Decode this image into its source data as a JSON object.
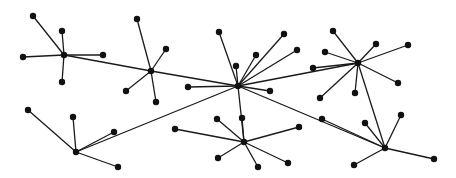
{
  "diagram": {
    "type": "network-graph",
    "colors": {
      "edge": "#1a1a1a",
      "node": "#111111",
      "background": "#ffffff"
    },
    "node_radius": 3.2,
    "nodes": [
      {
        "id": "h1",
        "x": 64,
        "y": 55,
        "role": "hub"
      },
      {
        "id": "a1",
        "x": 33,
        "y": 16
      },
      {
        "id": "a2",
        "x": 62,
        "y": 31
      },
      {
        "id": "a3",
        "x": 23,
        "y": 57
      },
      {
        "id": "a4",
        "x": 103,
        "y": 55
      },
      {
        "id": "a5",
        "x": 62,
        "y": 82
      },
      {
        "id": "h2",
        "x": 151,
        "y": 71,
        "role": "hub"
      },
      {
        "id": "b1",
        "x": 137,
        "y": 19
      },
      {
        "id": "b2",
        "x": 166,
        "y": 49
      },
      {
        "id": "b3",
        "x": 126,
        "y": 91
      },
      {
        "id": "b4",
        "x": 156,
        "y": 102
      },
      {
        "id": "hc",
        "x": 238,
        "y": 86,
        "role": "hub"
      },
      {
        "id": "c1",
        "x": 219,
        "y": 32
      },
      {
        "id": "c2",
        "x": 284,
        "y": 34
      },
      {
        "id": "c3",
        "x": 256,
        "y": 55
      },
      {
        "id": "c4",
        "x": 236,
        "y": 66
      },
      {
        "id": "c5",
        "x": 297,
        "y": 50
      },
      {
        "id": "c6",
        "x": 270,
        "y": 91
      },
      {
        "id": "c7",
        "x": 188,
        "y": 87
      },
      {
        "id": "h4",
        "x": 358,
        "y": 63,
        "role": "hub"
      },
      {
        "id": "d1",
        "x": 333,
        "y": 31
      },
      {
        "id": "d2",
        "x": 376,
        "y": 44
      },
      {
        "id": "d3",
        "x": 408,
        "y": 45
      },
      {
        "id": "d4",
        "x": 325,
        "y": 52
      },
      {
        "id": "d5",
        "x": 313,
        "y": 68
      },
      {
        "id": "d6",
        "x": 398,
        "y": 83
      },
      {
        "id": "d7",
        "x": 355,
        "y": 93
      },
      {
        "id": "d8",
        "x": 320,
        "y": 98
      },
      {
        "id": "h5",
        "x": 76,
        "y": 152,
        "role": "hub"
      },
      {
        "id": "e1",
        "x": 28,
        "y": 110
      },
      {
        "id": "e2",
        "x": 73,
        "y": 117
      },
      {
        "id": "e3",
        "x": 114,
        "y": 132
      },
      {
        "id": "e4",
        "x": 118,
        "y": 167
      },
      {
        "id": "h6",
        "x": 244,
        "y": 142,
        "role": "hub"
      },
      {
        "id": "f1",
        "x": 175,
        "y": 129
      },
      {
        "id": "f2",
        "x": 217,
        "y": 119
      },
      {
        "id": "f3",
        "x": 242,
        "y": 118
      },
      {
        "id": "f4",
        "x": 299,
        "y": 127
      },
      {
        "id": "f5",
        "x": 218,
        "y": 158
      },
      {
        "id": "f6",
        "x": 258,
        "y": 167
      },
      {
        "id": "f7",
        "x": 288,
        "y": 163
      },
      {
        "id": "h7",
        "x": 385,
        "y": 148,
        "role": "hub"
      },
      {
        "id": "g1",
        "x": 322,
        "y": 119
      },
      {
        "id": "g2",
        "x": 365,
        "y": 123
      },
      {
        "id": "g3",
        "x": 401,
        "y": 115
      },
      {
        "id": "g4",
        "x": 354,
        "y": 165
      },
      {
        "id": "g5",
        "x": 434,
        "y": 159
      }
    ],
    "edges": [
      [
        "h1",
        "a1"
      ],
      [
        "h1",
        "a2"
      ],
      [
        "h1",
        "a3"
      ],
      [
        "h1",
        "a4"
      ],
      [
        "h1",
        "a5"
      ],
      [
        "h1",
        "h2"
      ],
      [
        "h2",
        "b1"
      ],
      [
        "h2",
        "b2"
      ],
      [
        "h2",
        "b3"
      ],
      [
        "h2",
        "b4"
      ],
      [
        "h2",
        "hc"
      ],
      [
        "hc",
        "c1"
      ],
      [
        "hc",
        "c2"
      ],
      [
        "hc",
        "c3"
      ],
      [
        "hc",
        "c4"
      ],
      [
        "hc",
        "c5"
      ],
      [
        "hc",
        "c6"
      ],
      [
        "hc",
        "c7"
      ],
      [
        "hc",
        "h4"
      ],
      [
        "hc",
        "h5"
      ],
      [
        "hc",
        "h6"
      ],
      [
        "hc",
        "h7"
      ],
      [
        "h4",
        "d1"
      ],
      [
        "h4",
        "d2"
      ],
      [
        "h4",
        "d3"
      ],
      [
        "h4",
        "d4"
      ],
      [
        "h4",
        "d5"
      ],
      [
        "h4",
        "d6"
      ],
      [
        "h4",
        "d7"
      ],
      [
        "h4",
        "d8"
      ],
      [
        "h4",
        "h7"
      ],
      [
        "h5",
        "e1"
      ],
      [
        "h5",
        "e2"
      ],
      [
        "h5",
        "e3"
      ],
      [
        "h5",
        "e4"
      ],
      [
        "h6",
        "f1"
      ],
      [
        "h6",
        "f2"
      ],
      [
        "h6",
        "f3"
      ],
      [
        "h6",
        "f4"
      ],
      [
        "h6",
        "f5"
      ],
      [
        "h6",
        "f6"
      ],
      [
        "h6",
        "f7"
      ],
      [
        "h7",
        "g1"
      ],
      [
        "h7",
        "g2"
      ],
      [
        "h7",
        "g3"
      ],
      [
        "h7",
        "g4"
      ],
      [
        "h7",
        "g5"
      ]
    ]
  }
}
